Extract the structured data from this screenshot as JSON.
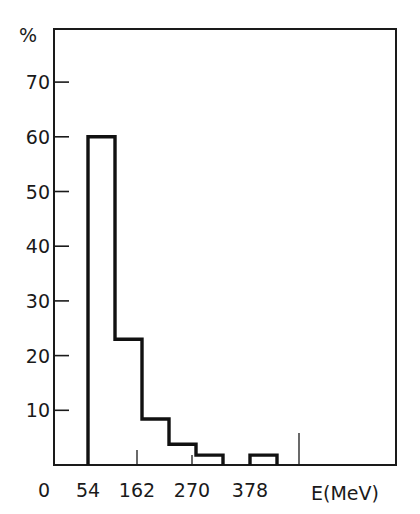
{
  "chart_data": {
    "type": "bar",
    "subtype": "histogram",
    "title": "",
    "xlabel": "E(MeV)",
    "ylabel": "%",
    "x_tick_labels": [
      "0",
      "54",
      "162",
      "270",
      "378"
    ],
    "y_tick_labels": [
      "10",
      "20",
      "30",
      "40",
      "50",
      "60",
      "70"
    ],
    "bin_width": 54,
    "bins": [
      {
        "from": 54,
        "to": 108,
        "value": 60
      },
      {
        "from": 108,
        "to": 162,
        "value": 23
      },
      {
        "from": 162,
        "to": 216,
        "value": 8.4
      },
      {
        "from": 216,
        "to": 270,
        "value": 3.8
      },
      {
        "from": 270,
        "to": 324,
        "value": 1.8
      },
      {
        "from": 324,
        "to": 378,
        "value": 0
      },
      {
        "from": 378,
        "to": 432,
        "value": 1.8
      }
    ],
    "categories": [
      "54-108",
      "108-162",
      "162-216",
      "216-270",
      "270-324",
      "324-378",
      "378-432"
    ],
    "values": [
      60,
      23,
      8.4,
      3.8,
      1.8,
      0,
      1.8
    ],
    "ylim": [
      0,
      78
    ],
    "xlim": [
      0,
      620
    ],
    "grid": false,
    "legend": null
  }
}
